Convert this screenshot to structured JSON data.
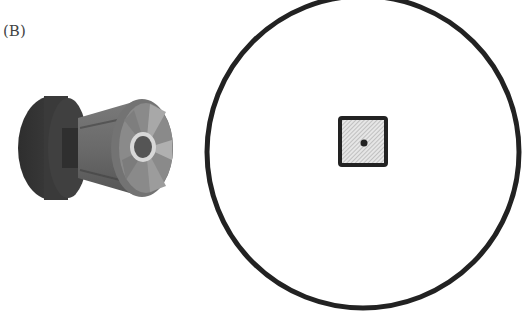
{
  "figure": {
    "panel_label": "(B)",
    "objects": [
      {
        "name": "spool-roller",
        "description": "3D cylindrical roller/spool with dark rear flange and lighter front face with central hub"
      },
      {
        "name": "outer-circle",
        "description": "large black outlined circle"
      },
      {
        "name": "center-square",
        "description": "small hatched square with black border at circle center"
      },
      {
        "name": "center-dot",
        "description": "black dot at the center of the square"
      }
    ],
    "colors": {
      "outline": "#222222",
      "hatch_fill": "#d4d4d4",
      "spool_dark": "#3c3c3c",
      "spool_mid": "#6b6b6b",
      "spool_light": "#9a9a9a"
    }
  }
}
